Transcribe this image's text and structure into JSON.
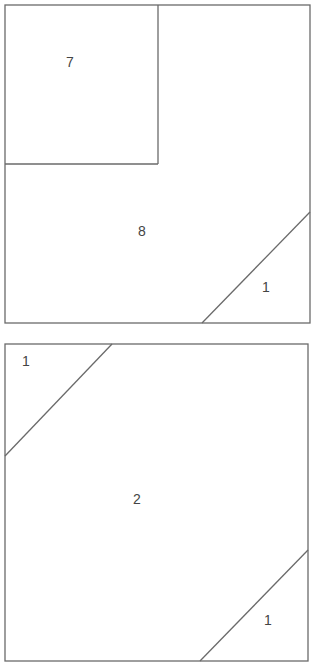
{
  "colors": {
    "stroke": "#6a6a6a",
    "label": "#444444",
    "background": "#ffffff"
  },
  "diagrams": [
    {
      "name": "square-1",
      "outline": {
        "x": 5,
        "y": 5,
        "w": 305,
        "h": 318
      },
      "lines": [
        {
          "name": "inner-square-right",
          "x1": 158,
          "y1": 5,
          "x2": 158,
          "y2": 164
        },
        {
          "name": "inner-square-bottom",
          "x1": 5,
          "y1": 164,
          "x2": 158,
          "y2": 164
        },
        {
          "name": "diagonal-bottom-right",
          "x1": 202,
          "y1": 323,
          "x2": 310,
          "y2": 212
        }
      ],
      "labels": [
        {
          "text": "7",
          "x": 70,
          "y": 63
        },
        {
          "text": "8",
          "x": 142,
          "y": 232
        },
        {
          "text": "1",
          "x": 266,
          "y": 288
        }
      ]
    },
    {
      "name": "square-2",
      "outline": {
        "x": 5,
        "y": 344,
        "w": 303,
        "h": 317
      },
      "lines": [
        {
          "name": "diagonal-top-left",
          "x1": 112,
          "y1": 344,
          "x2": 5,
          "y2": 456
        },
        {
          "name": "diagonal-bottom-right",
          "x1": 200,
          "y1": 661,
          "x2": 308,
          "y2": 550
        }
      ],
      "labels": [
        {
          "text": "1",
          "x": 26,
          "y": 362
        },
        {
          "text": "2",
          "x": 137,
          "y": 500
        },
        {
          "text": "1",
          "x": 268,
          "y": 621
        }
      ]
    }
  ]
}
